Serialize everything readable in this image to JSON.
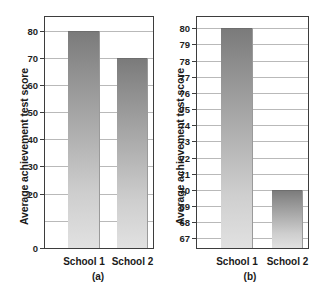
{
  "figure": {
    "panels": [
      {
        "key": "a",
        "caption": "(a)",
        "ylabel": "Average achievement test score",
        "chart_data": {
          "type": "bar",
          "title": "",
          "xlabel": "",
          "ylabel": "Average achievement test score",
          "categories": [
            "School 1",
            "School 2"
          ],
          "values": [
            80,
            70
          ],
          "ylim": [
            0,
            85
          ],
          "yticks": [
            0,
            20,
            30,
            40,
            50,
            60,
            70,
            80
          ],
          "ytick_labels": [
            "0",
            "20",
            "30",
            "40",
            "50",
            "60",
            "70",
            "80"
          ],
          "gridlines": [
            10,
            20,
            30,
            40,
            50,
            60,
            70,
            80
          ],
          "grid": true,
          "legend": "none",
          "bar_fill": "#a8a8a8"
        }
      },
      {
        "key": "b",
        "caption": "(b)",
        "ylabel": "Average achievement test score",
        "chart_data": {
          "type": "bar",
          "title": "",
          "xlabel": "",
          "ylabel": "Average achievement test score",
          "categories": [
            "School 1",
            "School 2"
          ],
          "values": [
            80,
            70
          ],
          "ylim": [
            66.4,
            80.7
          ],
          "yticks": [
            67,
            68,
            69,
            70,
            71,
            72,
            73,
            74,
            75,
            76,
            77,
            78,
            79,
            80
          ],
          "ytick_labels": [
            "67",
            "68",
            "69",
            "70",
            "71",
            "72",
            "73",
            "74",
            "75",
            "76",
            "77",
            "78",
            "79",
            "80"
          ],
          "gridlines": [
            67,
            68,
            69,
            70,
            71,
            72,
            73,
            74,
            75,
            76,
            77,
            78,
            79,
            80
          ],
          "grid": true,
          "legend": "none",
          "bar_fill": "#a8a8a8"
        }
      }
    ]
  }
}
